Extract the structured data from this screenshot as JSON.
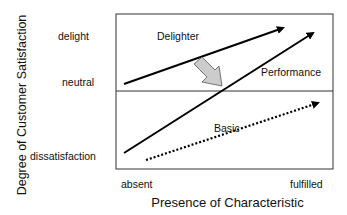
{
  "diagram": {
    "y_axis_label": "Degree of Customer Satisfaction",
    "x_axis_label": "Presence of Characteristic",
    "y_ticks": [
      "delight",
      "neutral",
      "dissatisfaction"
    ],
    "x_ticks": [
      "absent",
      "fulfilled"
    ],
    "curves": [
      {
        "name": "Delighter",
        "style": "solid",
        "label": "Delighter"
      },
      {
        "name": "Performance",
        "style": "solid",
        "label": "Performance"
      },
      {
        "name": "Basic",
        "style": "dotted",
        "label": "Basic"
      }
    ],
    "transition_arrow": {
      "from": "Delighter",
      "to": "Performance",
      "color": "#cfcfcf"
    }
  }
}
